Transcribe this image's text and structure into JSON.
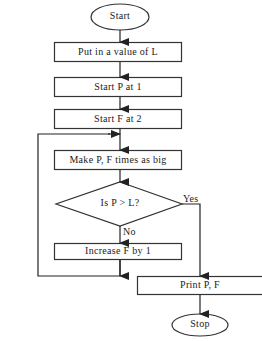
{
  "diagram": {
    "type": "flowchart",
    "colors": {
      "stroke": "#333333",
      "text": "#222222",
      "background": "#ffffff"
    },
    "nodes": [
      {
        "id": "start",
        "shape": "ellipse",
        "label": "Start"
      },
      {
        "id": "input_l",
        "shape": "rect",
        "label": "Put in a value of L"
      },
      {
        "id": "init_p",
        "shape": "rect",
        "label": "Start P at 1"
      },
      {
        "id": "init_f",
        "shape": "rect",
        "label": "Start F at 2"
      },
      {
        "id": "multiply",
        "shape": "rect",
        "label": "Make P, F times as big"
      },
      {
        "id": "decision",
        "shape": "diamond",
        "label": "Is P > L?"
      },
      {
        "id": "increment",
        "shape": "rect",
        "label": "Increase F by 1"
      },
      {
        "id": "print",
        "shape": "rect",
        "label": "Print P, F"
      },
      {
        "id": "stop",
        "shape": "ellipse",
        "label": "Stop"
      }
    ],
    "edges": [
      {
        "from": "start",
        "to": "input_l",
        "label": ""
      },
      {
        "from": "input_l",
        "to": "init_p",
        "label": ""
      },
      {
        "from": "init_p",
        "to": "init_f",
        "label": ""
      },
      {
        "from": "init_f",
        "to": "multiply",
        "label": ""
      },
      {
        "from": "multiply",
        "to": "decision",
        "label": ""
      },
      {
        "from": "decision",
        "to": "print",
        "label": "Yes"
      },
      {
        "from": "decision",
        "to": "increment",
        "label": "No"
      },
      {
        "from": "increment",
        "to": "multiply",
        "label": ""
      },
      {
        "from": "print",
        "to": "stop",
        "label": ""
      }
    ]
  }
}
